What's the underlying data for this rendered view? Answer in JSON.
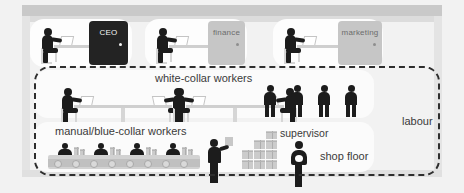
{
  "diagram": {
    "colors": {
      "background": "#f2f2f2",
      "panel": "#fdfdfd",
      "ceiling": "#c9c9c9",
      "wall": "#e4e4e4",
      "figure": "#1c1c1c",
      "door_executive": "#232323",
      "door_department": "#c6c6c6",
      "dashed_border": "#2e2e2e",
      "label_text": "#3a3a3a"
    }
  },
  "offices": [
    {
      "id": "ceo",
      "door_label": "CEO",
      "door_style": "dark",
      "worker_count": 1
    },
    {
      "id": "finance",
      "door_label": "finance",
      "door_style": "light",
      "worker_count": 1
    },
    {
      "id": "marketing",
      "door_label": "marketing",
      "door_style": "light",
      "worker_count": 1
    }
  ],
  "tiers": {
    "white_collar": {
      "label": "white-collar workers",
      "desk_pairs": 2,
      "standing_staff": 4
    },
    "blue_collar": {
      "label": "manual/blue-collar workers",
      "line_workers": 4,
      "foreman": 1
    },
    "shop_floor": {
      "supervisor_label": "supervisor",
      "floor_label": "shop floor",
      "crate_stacks": 4
    }
  },
  "grouping": {
    "label": "labour",
    "style": "dashed"
  }
}
